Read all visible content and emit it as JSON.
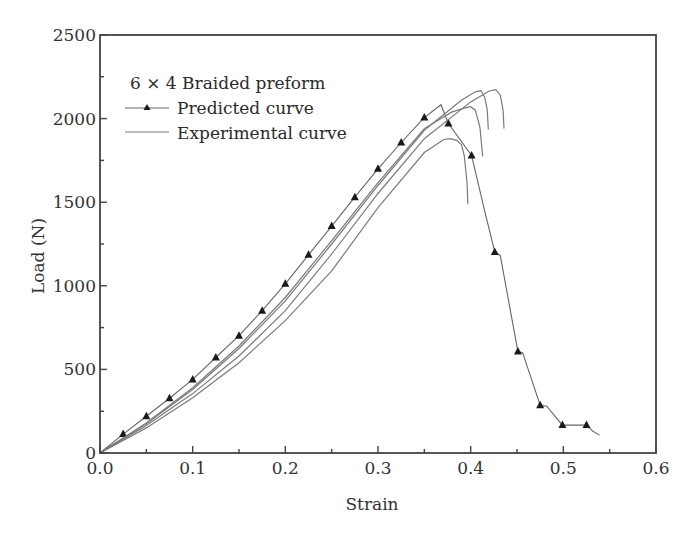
{
  "chart_data": {
    "type": "line",
    "title": "",
    "xlabel": "Strain",
    "ylabel": "Load (N)",
    "xlim": [
      0.0,
      0.6
    ],
    "ylim": [
      0,
      2500
    ],
    "xticks": [
      "0.0",
      "0.1",
      "0.2",
      "0.3",
      "0.4",
      "0.5",
      "0.6"
    ],
    "xtick_values": [
      0.0,
      0.1,
      0.2,
      0.3,
      0.4,
      0.5,
      0.6
    ],
    "xminor": [
      0.05,
      0.15,
      0.25,
      0.35,
      0.45,
      0.55
    ],
    "yticks": [
      "0",
      "500",
      "1000",
      "1500",
      "2000",
      "2500"
    ],
    "ytick_values": [
      0,
      500,
      1000,
      1500,
      2000,
      2500
    ],
    "yminor": [
      250,
      750,
      1250,
      1750,
      2250
    ],
    "grid": false,
    "legend": {
      "title": "6 × 4 Braided preform",
      "position": "upper left",
      "entries": [
        {
          "label": "Predicted curve",
          "style": "line-with-triangle-markers"
        },
        {
          "label": "Experimental curve",
          "style": "line"
        }
      ]
    },
    "series": [
      {
        "name": "Predicted curve",
        "markers": "triangle",
        "x": [
          0.0,
          0.025,
          0.05,
          0.075,
          0.1,
          0.125,
          0.15,
          0.175,
          0.2,
          0.225,
          0.25,
          0.275,
          0.3,
          0.325,
          0.35,
          0.368,
          0.376,
          0.401,
          0.415,
          0.426,
          0.432,
          0.451,
          0.456,
          0.475,
          0.482,
          0.499,
          0.525,
          0.532,
          0.539
        ],
        "y": [
          0,
          113,
          220,
          327,
          440,
          571,
          702,
          851,
          1012,
          1185,
          1357,
          1530,
          1700,
          1857,
          2006,
          2083,
          1970,
          1780,
          1450,
          1202,
          1180,
          607,
          600,
          286,
          280,
          167,
          167,
          130,
          107
        ],
        "marker_x": [
          0.025,
          0.05,
          0.075,
          0.1,
          0.125,
          0.15,
          0.175,
          0.2,
          0.225,
          0.25,
          0.275,
          0.3,
          0.325,
          0.35,
          0.376,
          0.401,
          0.426,
          0.451,
          0.475,
          0.499,
          0.525
        ],
        "marker_y": [
          113,
          220,
          327,
          440,
          571,
          702,
          851,
          1012,
          1185,
          1357,
          1530,
          1700,
          1857,
          2006,
          1970,
          1780,
          1202,
          607,
          286,
          167,
          167
        ]
      },
      {
        "name": "Experimental curve 1",
        "x": [
          0.0,
          0.05,
          0.1,
          0.15,
          0.2,
          0.25,
          0.3,
          0.35,
          0.38,
          0.395,
          0.4,
          0.405,
          0.41,
          0.413
        ],
        "y": [
          0,
          180,
          390,
          640,
          930,
          1270,
          1617,
          1940,
          2040,
          2065,
          2071,
          2050,
          1950,
          1774
        ]
      },
      {
        "name": "Experimental curve 2",
        "x": [
          0.0,
          0.05,
          0.1,
          0.15,
          0.2,
          0.25,
          0.3,
          0.35,
          0.39,
          0.405,
          0.411,
          0.415,
          0.418,
          0.419
        ],
        "y": [
          0,
          175,
          380,
          625,
          910,
          1250,
          1600,
          1930,
          2110,
          2160,
          2167,
          2130,
          2050,
          1935
        ]
      },
      {
        "name": "Experimental curve 3",
        "x": [
          0.0,
          0.05,
          0.1,
          0.15,
          0.2,
          0.25,
          0.3,
          0.35,
          0.4,
          0.42,
          0.427,
          0.432,
          0.435,
          0.436
        ],
        "y": [
          0,
          165,
          355,
          580,
          851,
          1190,
          1552,
          1880,
          2100,
          2165,
          2173,
          2140,
          2050,
          1940
        ]
      },
      {
        "name": "Experimental curve 4",
        "x": [
          0.0,
          0.05,
          0.1,
          0.15,
          0.2,
          0.25,
          0.3,
          0.35,
          0.371,
          0.378,
          0.385,
          0.39,
          0.393,
          0.396,
          0.397
        ],
        "y": [
          0,
          150,
          330,
          540,
          792,
          1089,
          1468,
          1797,
          1875,
          1880,
          1870,
          1845,
          1780,
          1620,
          1488
        ]
      }
    ]
  }
}
